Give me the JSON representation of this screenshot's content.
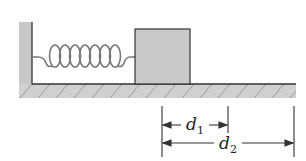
{
  "figure": {
    "colors": {
      "wall_fill": "#c8c8c8",
      "block_fill": "#c9c9c9",
      "outline": "#333333",
      "spring": "#777777",
      "hatch": "#9a9a9a",
      "dimension": "#333333"
    },
    "labels": {
      "d1": {
        "main": "d",
        "sub": "1"
      },
      "d2": {
        "main": "d",
        "sub": "2"
      }
    },
    "spring": {
      "coil_count": 7
    }
  }
}
